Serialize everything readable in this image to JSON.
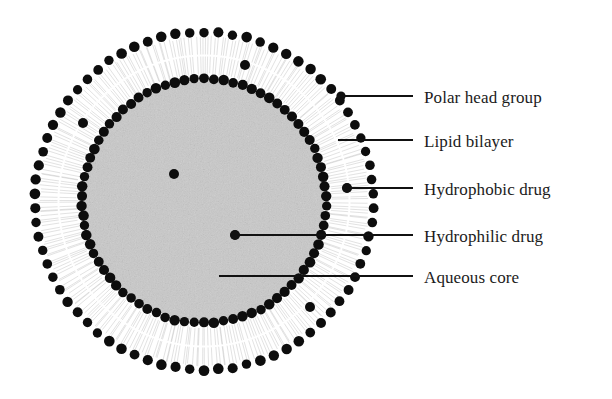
{
  "diagram": {
    "type": "cross-section-schematic",
    "background_color": "#ffffff",
    "ink_color": "#111111"
  },
  "structure": {
    "center": {
      "x": 204,
      "y": 201
    },
    "outer_head_ring": {
      "name": "outer polar head ring",
      "radius": 169,
      "dot_radius": 5.0,
      "dot_count": 74,
      "color": "#0d0d0d"
    },
    "inner_head_ring": {
      "name": "inner polar head ring",
      "radius": 122,
      "dot_radius": 5.0,
      "dot_count": 78,
      "color": "#0d0d0d"
    },
    "bilayer_region": {
      "name": "lipid bilayer tail region",
      "outer_radius": 169,
      "inner_radius": 122,
      "fill": "#ffffff",
      "tail_color": "#b9b9b9",
      "tail_count": 300
    },
    "aqueous_core": {
      "name": "aqueous core",
      "radius": 120,
      "fill": "#c9c9c9"
    }
  },
  "markers": {
    "hydrophobic_drug": {
      "color": "#0d0d0d",
      "radius": 5.0,
      "points": [
        {
          "x": 83,
          "y": 123
        },
        {
          "x": 245,
          "y": 65
        },
        {
          "x": 310,
          "y": 307
        },
        {
          "x": 347,
          "y": 188
        }
      ]
    },
    "hydrophilic_drug": {
      "color": "#0d0d0d",
      "radius": 5.0,
      "points": [
        {
          "x": 174,
          "y": 174
        },
        {
          "x": 235,
          "y": 235
        }
      ]
    }
  },
  "callouts": [
    {
      "id": "polar-head-group",
      "label": "Polar head group",
      "line": {
        "x1": 341,
        "y1": 96,
        "x2": 413,
        "y2": 96
      },
      "anchor_dot": {
        "x": 341,
        "y": 96
      },
      "text": {
        "x": 424,
        "y": 98
      }
    },
    {
      "id": "lipid-bilayer",
      "label": "Lipid bilayer",
      "line": {
        "x1": 338,
        "y1": 140,
        "x2": 413,
        "y2": 140
      },
      "anchor_dot": null,
      "text": {
        "x": 424,
        "y": 142
      }
    },
    {
      "id": "hydrophobic-drug",
      "label": "Hydrophobic drug",
      "line": {
        "x1": 347,
        "y1": 188,
        "x2": 413,
        "y2": 188
      },
      "anchor_dot": {
        "x": 347,
        "y": 188
      },
      "text": {
        "x": 424,
        "y": 190
      }
    },
    {
      "id": "hydrophilic-drug",
      "label": "Hydrophilic drug",
      "line": {
        "x1": 235,
        "y1": 235,
        "x2": 413,
        "y2": 235
      },
      "anchor_dot": {
        "x": 235,
        "y": 235
      },
      "text": {
        "x": 424,
        "y": 237
      }
    },
    {
      "id": "aqueous-core",
      "label": "Aqueous core",
      "line": {
        "x1": 219,
        "y1": 276,
        "x2": 413,
        "y2": 276
      },
      "anchor_dot": null,
      "text": {
        "x": 424,
        "y": 278
      }
    }
  ]
}
